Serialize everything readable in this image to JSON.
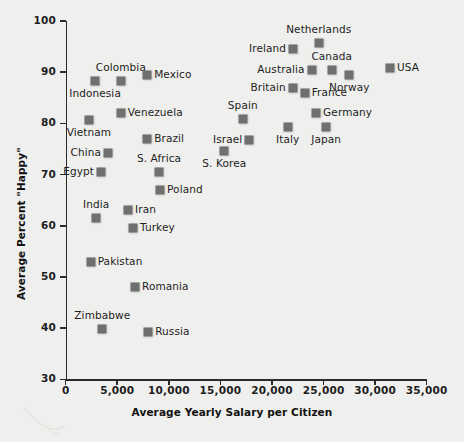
{
  "chart_data": {
    "type": "scatter",
    "title": "",
    "xlabel": "Average Yearly Salary per Citizen",
    "ylabel": "Average Percent \"Happy\"",
    "xlim": [
      0,
      35000
    ],
    "ylim": [
      30,
      100
    ],
    "xticks": [
      "0",
      "5,000",
      "10,000",
      "15,000",
      "20,000",
      "25,000",
      "30,000",
      "35,000"
    ],
    "xtick_values": [
      0,
      5000,
      10000,
      15000,
      20000,
      25000,
      30000,
      35000
    ],
    "yticks": [
      "30",
      "40",
      "50",
      "60",
      "70",
      "80",
      "90",
      "100"
    ],
    "ytick_values": [
      30,
      40,
      50,
      60,
      70,
      80,
      90,
      100
    ],
    "grid": false,
    "legend": null,
    "marker_color": "#6f6f6f",
    "background_color": "#efefed",
    "points": [
      {
        "label": "Indonesia",
        "x": 2850,
        "y": 88.2,
        "lpos": "below"
      },
      {
        "label": "Colombia",
        "x": 5350,
        "y": 88.2,
        "lpos": "above"
      },
      {
        "label": "Mexico",
        "x": 7900,
        "y": 89.5,
        "lpos": "right"
      },
      {
        "label": "Vietnam",
        "x": 2250,
        "y": 80.7,
        "lpos": "below"
      },
      {
        "label": "Venezuela",
        "x": 5350,
        "y": 82.0,
        "lpos": "right"
      },
      {
        "label": "Brazil",
        "x": 7900,
        "y": 77.0,
        "lpos": "right"
      },
      {
        "label": "China",
        "x": 4100,
        "y": 74.3,
        "lpos": "left"
      },
      {
        "label": "Egypt",
        "x": 3420,
        "y": 70.5,
        "lpos": "left"
      },
      {
        "label": "S. Africa",
        "x": 9050,
        "y": 70.5,
        "lpos": "above"
      },
      {
        "label": "Poland",
        "x": 9150,
        "y": 66.9,
        "lpos": "right"
      },
      {
        "label": "India",
        "x": 2950,
        "y": 61.5,
        "lpos": "above"
      },
      {
        "label": "Iran",
        "x": 6050,
        "y": 63.1,
        "lpos": "right"
      },
      {
        "label": "Turkey",
        "x": 6530,
        "y": 59.5,
        "lpos": "right"
      },
      {
        "label": "Pakistan",
        "x": 2420,
        "y": 53.0,
        "lpos": "right"
      },
      {
        "label": "Romania",
        "x": 6720,
        "y": 48.0,
        "lpos": "right"
      },
      {
        "label": "Zimbabwe",
        "x": 3550,
        "y": 39.9,
        "lpos": "above"
      },
      {
        "label": "Russia",
        "x": 8000,
        "y": 39.3,
        "lpos": "right"
      },
      {
        "label": "S. Korea",
        "x": 15380,
        "y": 74.6,
        "lpos": "below"
      },
      {
        "label": "Israel",
        "x": 17800,
        "y": 76.8,
        "lpos": "left"
      },
      {
        "label": "Spain",
        "x": 17170,
        "y": 80.9,
        "lpos": "above"
      },
      {
        "label": "Italy",
        "x": 21530,
        "y": 79.2,
        "lpos": "below"
      },
      {
        "label": "Japan",
        "x": 25250,
        "y": 79.2,
        "lpos": "below"
      },
      {
        "label": "Germany",
        "x": 24280,
        "y": 82.1,
        "lpos": "right"
      },
      {
        "label": "Britain",
        "x": 22010,
        "y": 87.0,
        "lpos": "left"
      },
      {
        "label": "France",
        "x": 23170,
        "y": 86.0,
        "lpos": "right"
      },
      {
        "label": "Australia",
        "x": 23850,
        "y": 90.4,
        "lpos": "left"
      },
      {
        "label": "Canada",
        "x": 25790,
        "y": 90.4,
        "lpos": "above"
      },
      {
        "label": "Ireland",
        "x": 22050,
        "y": 94.5,
        "lpos": "left"
      },
      {
        "label": "Netherlands",
        "x": 24530,
        "y": 95.7,
        "lpos": "above"
      },
      {
        "label": "Norway",
        "x": 27500,
        "y": 89.4,
        "lpos": "below"
      },
      {
        "label": "USA",
        "x": 31450,
        "y": 90.9,
        "lpos": "right"
      }
    ]
  }
}
